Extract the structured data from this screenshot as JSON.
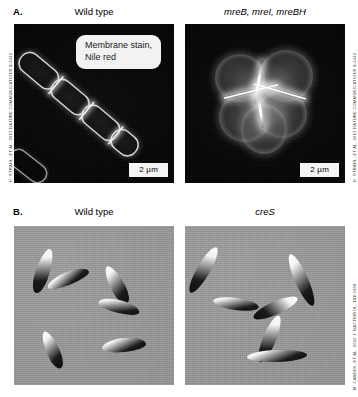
{
  "figure": {
    "panels": [
      {
        "id": "A",
        "letter": "A.",
        "columns": [
          {
            "header": "Wild type",
            "italic": false
          },
          {
            "header": "mreB, mreI, mreBH",
            "italic": true
          }
        ],
        "callout": "Membrane stain,\nNile red",
        "scalebar_left": "2 µm",
        "scalebar_right": "2 µm",
        "credit_left": "H. STRAHL, ET AL. 2013 NATURE COMMUNICATIONS ",
        "credit_left_vol": "5",
        "credit_left_tail": ":3442",
        "credit_right": "H. STRAHL, ET AL. 2013 NATURE COMMUNICATIONS ",
        "credit_right_vol": "5",
        "credit_right_tail": ":3442"
      },
      {
        "id": "B",
        "letter": "B.",
        "columns": [
          {
            "header": "Wild type",
            "italic": false
          },
          {
            "header": "creS",
            "italic": true
          }
        ],
        "credit_right": "M. CABEEN, ET AL. 2010 J. BACTERIOL. ",
        "credit_right_vol": "192",
        "credit_right_tail": ":3368"
      }
    ]
  },
  "colors": {
    "fluorescence_background": "#000000",
    "phase_background": "#9a9a9a",
    "callout_background": "#f2f2f2",
    "scalebar_background": "#f4f4f4",
    "text": "#000000"
  }
}
